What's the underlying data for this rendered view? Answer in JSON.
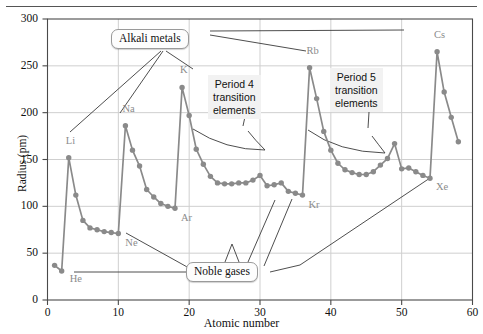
{
  "figure": {
    "title": "",
    "y_axis_label": "Radius (pm)",
    "x_axis_label": "Atomic number"
  },
  "axis": {
    "y_ticks": [
      "0",
      "50",
      "100",
      "150",
      "200",
      "250",
      "300"
    ],
    "x_ticks": [
      "0",
      "10",
      "20",
      "30",
      "40",
      "50",
      "60"
    ]
  },
  "element_labels": [
    {
      "text": "He",
      "x": 2,
      "y": 31,
      "dx": 8,
      "dy": 10
    },
    {
      "text": "Li",
      "x": 3,
      "y": 152,
      "dx": -3,
      "dy": -15
    },
    {
      "text": "Ne",
      "x": 10,
      "y": 71,
      "dx": 7,
      "dy": 12
    },
    {
      "text": "Na",
      "x": 11,
      "y": 186,
      "dx": -3,
      "dy": -15
    },
    {
      "text": "Ar",
      "x": 18,
      "y": 98,
      "dx": 6,
      "dy": 12
    },
    {
      "text": "K",
      "x": 19,
      "y": 227,
      "dx": -2,
      "dy": -15
    },
    {
      "text": "Kr",
      "x": 36,
      "y": 112,
      "dx": 6,
      "dy": 12
    },
    {
      "text": "Rb",
      "x": 37,
      "y": 248,
      "dx": -3,
      "dy": -15
    },
    {
      "text": "Xe",
      "x": 54,
      "y": 130,
      "dx": 6,
      "dy": 11
    },
    {
      "text": "Cs",
      "x": 55,
      "y": 265,
      "dx": -3,
      "dy": -15
    }
  ],
  "callouts": [
    {
      "name": "alkali-metals",
      "label": "Alkali metals"
    },
    {
      "name": "noble-gases",
      "label": "Noble gases"
    }
  ],
  "annotations": [
    {
      "name": "period-4-transition",
      "lines": [
        "Period 4",
        "transition",
        "elements"
      ]
    },
    {
      "name": "period-5-transition",
      "lines": [
        "Period 5",
        "transition",
        "elements"
      ]
    }
  ],
  "colors": {
    "line": "#8a8a8a",
    "marker": "#8a8a8a",
    "grid": "#cfcfcf",
    "axis": "#4a4a4a",
    "label_text": "#8b8b8b",
    "annotation_bg": "#f2f2f2",
    "callout_bg": "#fdfdfd"
  },
  "chart_data": {
    "type": "line",
    "title": "",
    "xlabel": "Atomic number",
    "ylabel": "Radius (pm)",
    "xlim": [
      0,
      60
    ],
    "ylim": [
      0,
      300
    ],
    "grid": true,
    "legend": "none",
    "markers": true,
    "x": [
      1,
      2,
      3,
      4,
      5,
      6,
      7,
      8,
      9,
      10,
      11,
      12,
      13,
      14,
      15,
      16,
      17,
      18,
      19,
      20,
      21,
      22,
      23,
      24,
      25,
      26,
      27,
      28,
      29,
      30,
      31,
      32,
      33,
      34,
      35,
      36,
      37,
      38,
      39,
      40,
      41,
      42,
      43,
      44,
      45,
      46,
      47,
      48,
      49,
      50,
      51,
      52,
      53,
      54,
      55,
      56,
      57,
      58
    ],
    "values": [
      37,
      31,
      152,
      112,
      85,
      77,
      75,
      73,
      72,
      71,
      186,
      160,
      143,
      118,
      110,
      103,
      100,
      98,
      227,
      197,
      161,
      145,
      132,
      125,
      124,
      124,
      125,
      125,
      128,
      133,
      122,
      123,
      125,
      116,
      114,
      112,
      248,
      215,
      180,
      160,
      146,
      139,
      136,
      134,
      134,
      137,
      144,
      151,
      167,
      140,
      141,
      137,
      133,
      130,
      265,
      222,
      195,
      169
    ],
    "series": [
      {
        "name": "Atomic radius",
        "points": [
          {
            "z": 1,
            "symbol": "H",
            "radius": 37
          },
          {
            "z": 2,
            "symbol": "He",
            "radius": 31
          },
          {
            "z": 3,
            "symbol": "Li",
            "radius": 152
          },
          {
            "z": 4,
            "symbol": "Be",
            "radius": 112
          },
          {
            "z": 5,
            "symbol": "B",
            "radius": 85
          },
          {
            "z": 6,
            "symbol": "C",
            "radius": 77
          },
          {
            "z": 7,
            "symbol": "N",
            "radius": 75
          },
          {
            "z": 8,
            "symbol": "O",
            "radius": 73
          },
          {
            "z": 9,
            "symbol": "F",
            "radius": 72
          },
          {
            "z": 10,
            "symbol": "Ne",
            "radius": 71
          },
          {
            "z": 11,
            "symbol": "Na",
            "radius": 186
          },
          {
            "z": 12,
            "symbol": "Mg",
            "radius": 160
          },
          {
            "z": 13,
            "symbol": "Al",
            "radius": 143
          },
          {
            "z": 14,
            "symbol": "Si",
            "radius": 118
          },
          {
            "z": 15,
            "symbol": "P",
            "radius": 110
          },
          {
            "z": 16,
            "symbol": "S",
            "radius": 103
          },
          {
            "z": 17,
            "symbol": "Cl",
            "radius": 100
          },
          {
            "z": 18,
            "symbol": "Ar",
            "radius": 98
          },
          {
            "z": 19,
            "symbol": "K",
            "radius": 227
          },
          {
            "z": 20,
            "symbol": "Ca",
            "radius": 197
          },
          {
            "z": 21,
            "symbol": "Sc",
            "radius": 161
          },
          {
            "z": 22,
            "symbol": "Ti",
            "radius": 145
          },
          {
            "z": 23,
            "symbol": "V",
            "radius": 132
          },
          {
            "z": 24,
            "symbol": "Cr",
            "radius": 125
          },
          {
            "z": 25,
            "symbol": "Mn",
            "radius": 124
          },
          {
            "z": 26,
            "symbol": "Fe",
            "radius": 124
          },
          {
            "z": 27,
            "symbol": "Co",
            "radius": 125
          },
          {
            "z": 28,
            "symbol": "Ni",
            "radius": 125
          },
          {
            "z": 29,
            "symbol": "Cu",
            "radius": 128
          },
          {
            "z": 30,
            "symbol": "Zn",
            "radius": 133
          },
          {
            "z": 31,
            "symbol": "Ga",
            "radius": 122
          },
          {
            "z": 32,
            "symbol": "Ge",
            "radius": 123
          },
          {
            "z": 33,
            "symbol": "As",
            "radius": 125
          },
          {
            "z": 34,
            "symbol": "Se",
            "radius": 116
          },
          {
            "z": 35,
            "symbol": "Br",
            "radius": 114
          },
          {
            "z": 36,
            "symbol": "Kr",
            "radius": 112
          },
          {
            "z": 37,
            "symbol": "Rb",
            "radius": 248
          },
          {
            "z": 38,
            "symbol": "Sr",
            "radius": 215
          },
          {
            "z": 39,
            "symbol": "Y",
            "radius": 180
          },
          {
            "z": 40,
            "symbol": "Zr",
            "radius": 160
          },
          {
            "z": 41,
            "symbol": "Nb",
            "radius": 146
          },
          {
            "z": 42,
            "symbol": "Mo",
            "radius": 139
          },
          {
            "z": 43,
            "symbol": "Tc",
            "radius": 136
          },
          {
            "z": 44,
            "symbol": "Ru",
            "radius": 134
          },
          {
            "z": 45,
            "symbol": "Rh",
            "radius": 134
          },
          {
            "z": 46,
            "symbol": "Pd",
            "radius": 137
          },
          {
            "z": 47,
            "symbol": "Ag",
            "radius": 144
          },
          {
            "z": 48,
            "symbol": "Cd",
            "radius": 151
          },
          {
            "z": 49,
            "symbol": "In",
            "radius": 167
          },
          {
            "z": 50,
            "symbol": "Sn",
            "radius": 140
          },
          {
            "z": 51,
            "symbol": "Sb",
            "radius": 141
          },
          {
            "z": 52,
            "symbol": "Te",
            "radius": 137
          },
          {
            "z": 53,
            "symbol": "I",
            "radius": 133
          },
          {
            "z": 54,
            "symbol": "Xe",
            "radius": 130
          },
          {
            "z": 55,
            "symbol": "Cs",
            "radius": 265
          },
          {
            "z": 56,
            "symbol": "Ba",
            "radius": 222
          },
          {
            "z": 57,
            "symbol": "La",
            "radius": 195
          },
          {
            "z": 58,
            "symbol": "Ce",
            "radius": 169
          }
        ]
      }
    ]
  }
}
